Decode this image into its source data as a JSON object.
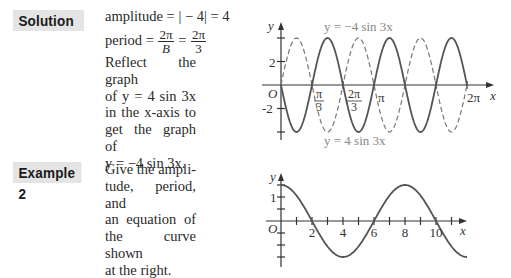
{
  "solution": {
    "label": "Solution",
    "amplitude_line": "amplitude = | − 4| = 4",
    "period_prefix": "period = ",
    "period_frac1_num": "2π",
    "period_frac1_den": "B",
    "period_eq": " = ",
    "period_frac2_num": "2π",
    "period_frac2_den": "3",
    "paragraph": [
      "Reflect the graph",
      "of  y = 4  sin  3x",
      "in  the  x-axis  to",
      "get  the  graph  of",
      "y = −4 sin 3x."
    ]
  },
  "example2": {
    "label": "Example 2",
    "paragraph": [
      "Give  the  ampli-",
      "tude, period, and",
      "an   equation   of",
      "the  curve  shown",
      "at the right."
    ]
  },
  "chart_data": [
    {
      "type": "line",
      "title": "",
      "xlabel": "x",
      "ylabel": "y",
      "origin_label": "O",
      "x_tick_labels": [
        "π/3",
        "2π/3",
        "π",
        "2π"
      ],
      "x_ticks": [
        1.0472,
        2.0944,
        3.1416,
        4.1888,
        5.236,
        6.2832
      ],
      "y_tick_labels": [
        "2",
        "-2"
      ],
      "y_ticks": [
        4,
        2,
        -2,
        -4
      ],
      "xlim": [
        0,
        6.2832
      ],
      "ylim": [
        -4,
        4
      ],
      "series": [
        {
          "name": "y = −4 sin 3x",
          "style": "solid",
          "function": "-4*sin(3x)",
          "amplitude": 4,
          "period": 2.0944
        },
        {
          "name": "y = 4 sin 3x",
          "style": "dashed",
          "function": "4*sin(3x)",
          "amplitude": 4,
          "period": 2.0944
        }
      ],
      "annotations": [
        "y = −4 sin 3x",
        "y = 4 sin 3x"
      ]
    },
    {
      "type": "line",
      "title": "",
      "xlabel": "x",
      "ylabel": "y",
      "origin_label": "O",
      "x_tick_labels": [
        "2",
        "4",
        "6",
        "8",
        "10"
      ],
      "x_ticks": [
        1,
        2,
        3,
        4,
        5,
        6,
        7,
        8,
        9,
        10,
        11
      ],
      "y_tick_labels": [
        "1"
      ],
      "y_ticks": [
        1.5,
        1,
        0.5,
        -0.5,
        -1,
        -1.5
      ],
      "xlim": [
        0,
        12
      ],
      "ylim": [
        -1.5,
        1.5
      ],
      "series": [
        {
          "name": "curve",
          "style": "solid",
          "function": "1.5*cos(pi*x/4)",
          "amplitude": 1.5,
          "period": 8,
          "points": [
            [
              0,
              1.5
            ],
            [
              2,
              0
            ],
            [
              4,
              -1.5
            ],
            [
              6,
              0
            ],
            [
              8,
              1.5
            ],
            [
              10,
              0
            ],
            [
              12,
              -1.5
            ]
          ]
        }
      ]
    }
  ]
}
